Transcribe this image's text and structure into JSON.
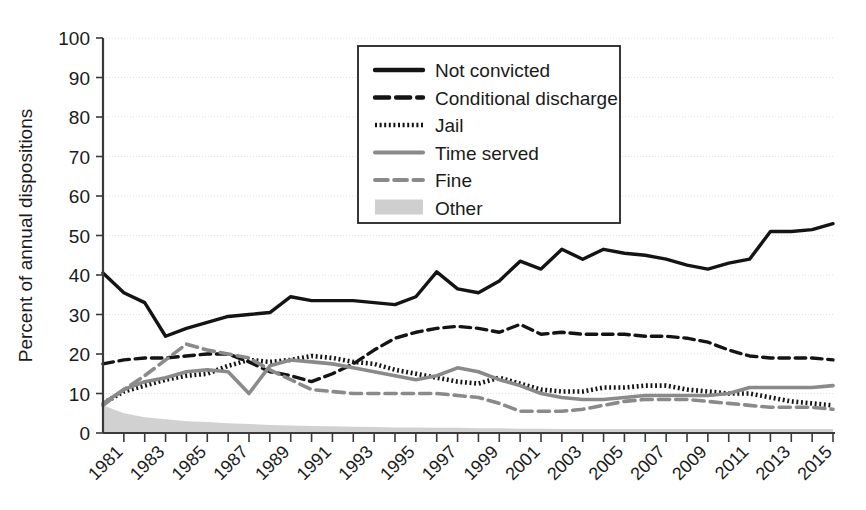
{
  "chart_data": {
    "type": "line",
    "title": "",
    "subtitle": "",
    "xlabel": "",
    "ylabel": "Percent of annual dispositions",
    "ylim": [
      0,
      100
    ],
    "ytick_values": [
      0,
      10,
      20,
      30,
      40,
      50,
      60,
      70,
      80,
      90,
      100
    ],
    "ytick_labels": [
      "0",
      "10",
      "20",
      "30",
      "40",
      "50",
      "60",
      "70",
      "80",
      "90",
      "100"
    ],
    "xlim": [
      1980,
      2015
    ],
    "x": [
      1980,
      1981,
      1982,
      1983,
      1984,
      1985,
      1986,
      1987,
      1988,
      1989,
      1990,
      1991,
      1992,
      1993,
      1994,
      1995,
      1996,
      1997,
      1998,
      1999,
      2000,
      2001,
      2002,
      2003,
      2004,
      2005,
      2006,
      2007,
      2008,
      2009,
      2010,
      2011,
      2012,
      2013,
      2014,
      2015
    ],
    "xtick_values": [
      1981,
      1983,
      1985,
      1987,
      1989,
      1991,
      1993,
      1995,
      1997,
      1999,
      2001,
      2003,
      2005,
      2007,
      2009,
      2011,
      2013,
      2015
    ],
    "xtick_labels": [
      "1981",
      "1983",
      "1985",
      "1987",
      "1989",
      "1991",
      "1993",
      "1995",
      "1997",
      "1999",
      "2001",
      "2003",
      "2005",
      "2007",
      "2009",
      "2011",
      "2013",
      "2015"
    ],
    "grid": true,
    "legend_position": "upper-center",
    "series": [
      {
        "name": "Not convicted",
        "style": "solid",
        "color": "#141414",
        "width": 3.4,
        "values": [
          40.5,
          35.5,
          33.0,
          24.5,
          26.5,
          28.0,
          29.5,
          30.0,
          30.5,
          34.5,
          33.5,
          33.5,
          33.5,
          33.0,
          32.5,
          34.5,
          40.8,
          36.5,
          35.5,
          38.5,
          43.5,
          41.5,
          46.5,
          44.0,
          46.5,
          45.5,
          45.0,
          44.0,
          42.5,
          41.5,
          43.0,
          44.0,
          51.0,
          51.0,
          51.5,
          53.0
        ]
      },
      {
        "name": "Conditional discharge",
        "style": "dashed",
        "color": "#141414",
        "width": 3.4,
        "values": [
          17.5,
          18.5,
          19.0,
          19.0,
          19.5,
          20.0,
          20.0,
          18.0,
          15.5,
          14.5,
          13.0,
          15.0,
          17.5,
          21.0,
          24.0,
          25.5,
          26.5,
          27.0,
          26.5,
          25.5,
          27.5,
          25.0,
          25.5,
          25.0,
          25.0,
          25.0,
          24.5,
          24.5,
          24.0,
          23.0,
          21.0,
          19.5,
          19.0,
          19.0,
          19.0,
          18.5
        ]
      },
      {
        "name": "Jail",
        "style": "dotted",
        "color": "#141414",
        "width": 4.6,
        "values": [
          7.5,
          10.5,
          12.0,
          13.5,
          14.5,
          15.0,
          17.0,
          18.5,
          18.0,
          18.5,
          19.5,
          19.0,
          18.0,
          17.5,
          16.0,
          15.0,
          14.0,
          13.0,
          12.5,
          14.0,
          12.5,
          11.0,
          10.5,
          10.5,
          11.5,
          11.5,
          12.0,
          12.0,
          11.0,
          10.5,
          10.0,
          10.0,
          9.0,
          8.0,
          7.5,
          7.0
        ]
      },
      {
        "name": "Time served",
        "style": "solid",
        "color": "#8a8a8a",
        "width": 3.6,
        "values": [
          7.5,
          11.0,
          13.0,
          14.0,
          15.5,
          16.0,
          15.5,
          10.0,
          17.0,
          18.5,
          18.0,
          17.5,
          16.5,
          15.5,
          14.5,
          13.5,
          14.5,
          16.5,
          15.5,
          13.5,
          12.0,
          10.0,
          9.0,
          8.5,
          8.5,
          9.0,
          9.5,
          9.5,
          9.5,
          9.5,
          10.0,
          11.5,
          11.5,
          11.5,
          11.5,
          12.0
        ]
      },
      {
        "name": "Fine",
        "style": "dashed",
        "color": "#8a8a8a",
        "width": 3.6,
        "values": [
          7.0,
          11.0,
          14.5,
          18.5,
          22.5,
          21.0,
          20.0,
          19.0,
          16.0,
          13.5,
          11.0,
          10.5,
          10.0,
          10.0,
          10.0,
          10.0,
          10.0,
          9.5,
          9.0,
          7.5,
          5.5,
          5.5,
          5.5,
          6.0,
          7.0,
          8.0,
          8.5,
          8.5,
          8.5,
          8.0,
          7.5,
          7.0,
          6.5,
          6.5,
          6.5,
          6.0
        ]
      },
      {
        "name": "Other",
        "style": "area",
        "color": "#cfcfcf",
        "width": 0,
        "values": [
          7.0,
          5.0,
          4.0,
          3.5,
          3.0,
          2.8,
          2.5,
          2.3,
          2.0,
          1.9,
          1.8,
          1.7,
          1.6,
          1.5,
          1.4,
          1.4,
          1.3,
          1.3,
          1.2,
          1.2,
          1.1,
          1.1,
          1.0,
          1.0,
          1.0,
          1.0,
          1.0,
          1.0,
          1.0,
          1.0,
          1.0,
          1.0,
          1.0,
          1.0,
          1.0,
          1.0
        ]
      }
    ],
    "legend": [
      {
        "label": "Not convicted",
        "style": "solid",
        "color": "#141414"
      },
      {
        "label": "Conditional discharge",
        "style": "dashed",
        "color": "#141414"
      },
      {
        "label": "Jail",
        "style": "dotted",
        "color": "#141414"
      },
      {
        "label": "Time served",
        "style": "solid",
        "color": "#8a8a8a"
      },
      {
        "label": "Fine",
        "style": "dashed",
        "color": "#8a8a8a"
      },
      {
        "label": "Other",
        "style": "area",
        "color": "#cfcfcf"
      }
    ]
  }
}
